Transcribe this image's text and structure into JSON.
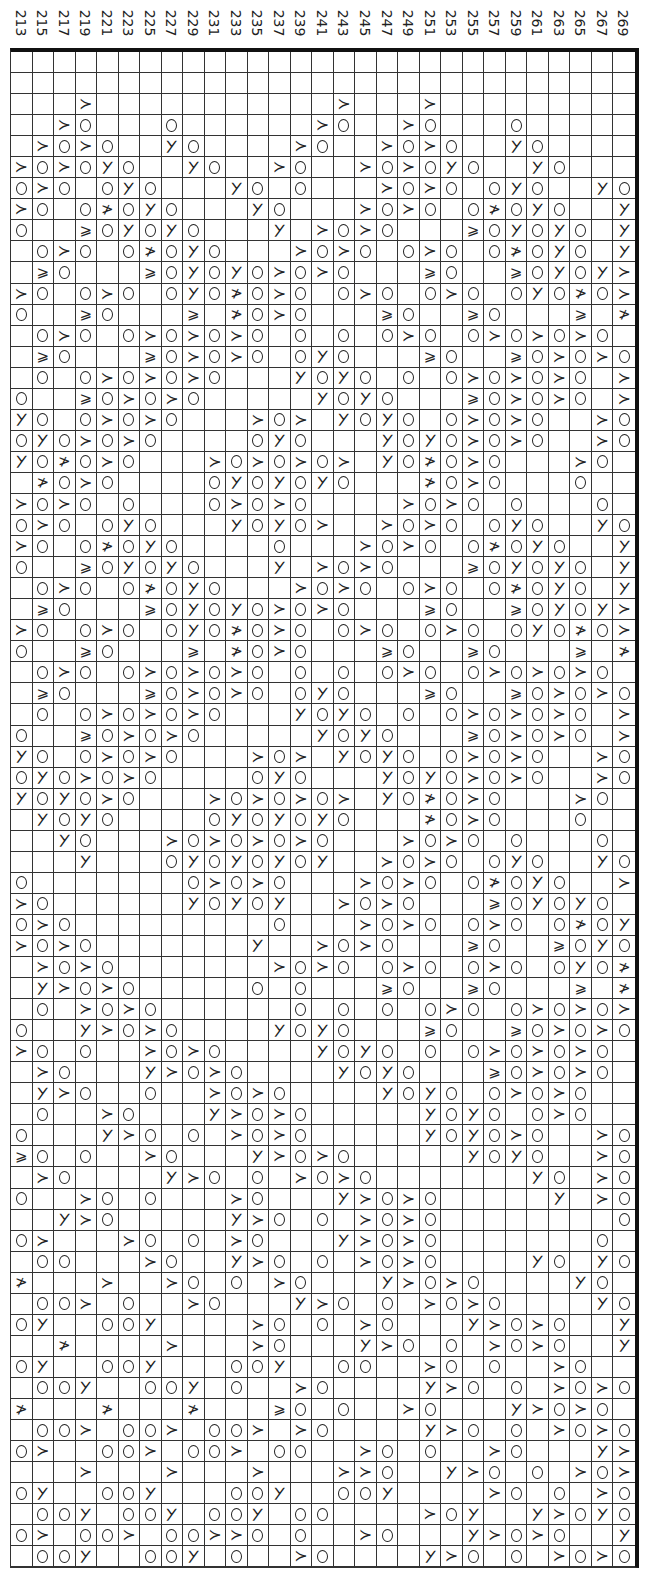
{
  "chart_data": {
    "type": "table",
    "title": "",
    "orientation": "rotated 90° (columns are chart rows)",
    "column_labels": [
      "213",
      "215",
      "217",
      "219",
      "221",
      "223",
      "225",
      "227",
      "229",
      "231",
      "233",
      "235",
      "237",
      "239",
      "241",
      "243",
      "245",
      "247",
      "249",
      "251",
      "253",
      "255",
      "257",
      "259",
      "261",
      "263",
      "265",
      "267",
      "269"
    ],
    "legend": {
      ".": "blank",
      "O": "yarn-over circle",
      "y": "decrease symbol (>)",
      "k": "decrease symbol (slanted >)",
      "t": "double decrease symbol (crossed >)",
      "w": "double decrease symbol (≥)"
    },
    "rows": [
      ".............................",
      ".............................",
      "...y...........y...y.........",
      "..yO...O......yO..yO...O.....",
      ".yOyO..kO....yO..yOyO..kO....",
      "yOyOkO..kO..yO..yOyOkO..kO...",
      "OyO.OkO...kO.O...yOyO.OkO..kO",
      "yO.OtOkO...kO...yOyO.OtOkO..k",
      "O..wOkOkO...k.yOyO...wOkOkO.k",
      ".OyO.OtOkO...yOyO.OyO.OtOkO.k",
      ".wO...wOkOkOyOyO...wO..wOkOky",
      "yO.OyO.OkOtOyO.OyO.OyO.OkOtOy",
      "O..wO...w.tOyO...wO..wO...w.t",
      ".OyO.OyOyOyO.O.O.OyO.OyOyOyO.",
      ".wO...wOyOyO.OkO...wO..wOyOyO",
      ".O.OyOyOyO...kOkO.O.OyOyOyO.y",
      "O..wOyOyO.....kOkO...wOyOyO.y",
      "kO.OyOyO...yOy.kOkO.OyOyO..yO",
      "OkOyOyO....OkO...kOkOyOyO..yO",
      "kOtOyO...yOyOyOy.kOtOyO...yO.",
      ".tOyO....OkOkOkO...tOyO...O..",
      "yOyO.O...OyOyO....yOyO.O...O.",
      "OyO.OkO...kOkOy..yOyO.OkO..kO",
      "yO.OtOkO....O...yOyO.OtOkO..k",
      "O..wOkOkO...k.yOyO...wOkOkO.k",
      ".OyO.OtOkO...yOyO.OyO.OtOkO.k",
      ".wO...wOkOkOyOyO...wO..wOkOky",
      "yO.OyO.OkOtOyO.OyO.OyO.OkOtOy",
      "O..wO...w.tOyO...wO..wO...w.t",
      ".OyO.OyOyOyO.O.O.OyO.OyOyOyO.",
      ".wO...wOyOyO.OkO...wO..wOyOyO",
      ".O.OyOyOyO...kOkO.O.OyOyOyO.y",
      "O..wOyOyO.....kOkO...wOyOyO.y",
      "kO.OyOyO...yOy.kOkO.OyOyO..yO",
      "OkOyOyO....OkO...kOkOyOyO..yO",
      "kOkOyO...yOyOyOy.kOtOyO...yO.",
      ".kOkO....OkOkOkO...tOyO...O..",
      "..kO...yOyOyOyO...yOyO.O...O.",
      "...k...OkOkOkOk..yOyO.OkO..kO",
      "O.......OyOyO...yOyO.OtOkO..y",
      "yO......kOkOk..yOyO...wOkOkO.k",
      "OyO.........O...yOyO.OyO.OtOkO",
      "yOyO.......k..yOyO...wO..wOkOy",
      ".yOyO.......yOyO.OyO.OyO.OkOtO",
      ".kyOyO.....O.O...wO..wO...w.tO",
      ".O.yOyO......O.O.O.OyO.OyOyOyO",
      "O..kyOyO....kOkO...wO..wOyOyO.",
      "yO.O..yOyO....kOkO.O.OyOyOyO.y",
      ".yO...kyOyO....kOkO...wOyOyO.y",
      ".kyO..O..yOyO....kOkO.OyOyO..y",
      ".O..yO...kyOyO.....kOkO.OyO..y",
      "O...kyO.O.yOyO.....kOkOyO..yO",
      "wO.O..yO...kyOyO.....kOkO..yO",
      ".yO....kyO.O.yOyO.......kO.yO",
      "O..yO.O...yO...kyOyO.....k.yO",
      "..kyO.....kyO.O.yOyO........O",
      "Oy...yO.O.yO...kyOyO.......O.",
      ".OO...yO..kyO.O.yOyO....kO.kO",
      "t...y..yO.O.yO...kyOyO....kO.kO",
      ".OOy.O..yO...kyO.O.yOyO....kO",
      "Ok..OOk....yO.O.yO...kyOyO..k",
      "..t....y...yO...kyO.O.yOyO..k",
      "Ok..OOk...OOk..OO..yO.O..yO..",
      ".OOk..OOk.O..yO....kyO.O.yOyO",
      "t...t...t...wO.O..yO...kyOyO.",
      ".OOy.OOy.OOy.yO....kyO.O.yOyO",
      "Oy..OOy.OOy.OO..yO.O..yO...kyO",
      "...y...y...y...yyO..kyO.O.yOyO",
      "Ok..OOk...OOk..OOk....yO.O.yO",
      ".OOk.OOk.OOk.OO....yOk..kyOkO",
      "Oy.OOy.OOyyO.O..yO...kyOyO..kO",
      ".OOk..OOk.O..yO....kyO.O.yOyO"
    ]
  },
  "header": {
    "labels": [
      "213",
      "215",
      "217",
      "219",
      "221",
      "223",
      "225",
      "227",
      "229",
      "231",
      "233",
      "235",
      "237",
      "239",
      "241",
      "243",
      "245",
      "247",
      "249",
      "251",
      "253",
      "255",
      "257",
      "259",
      "261",
      "263",
      "265",
      "267",
      "269"
    ]
  }
}
